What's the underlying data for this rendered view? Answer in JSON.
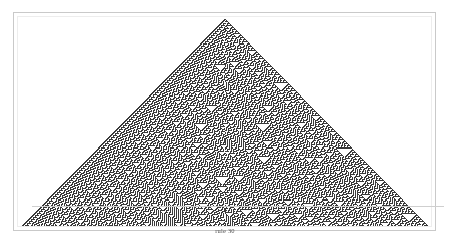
{
  "figure": {
    "caption": "rule 30",
    "title": "rule 30",
    "frame_color": "#c9c9c9",
    "background_color": "#ffffff",
    "cell_on_color": "#3a3a3a",
    "cell_off_color": "#ffffff"
  },
  "chart_data": {
    "type": "heatmap",
    "title": "rule 30",
    "subtitle": "",
    "xlabel": "",
    "ylabel": "",
    "rule_number": 30,
    "rule_binary": "00011110",
    "rule_table": [
      {
        "neighborhood": "111",
        "result": 0
      },
      {
        "neighborhood": "110",
        "result": 0
      },
      {
        "neighborhood": "101",
        "result": 0
      },
      {
        "neighborhood": "100",
        "result": 1
      },
      {
        "neighborhood": "011",
        "result": 1
      },
      {
        "neighborhood": "010",
        "result": 1
      },
      {
        "neighborhood": "001",
        "result": 1
      },
      {
        "neighborhood": "000",
        "result": 0
      }
    ],
    "initial_condition": "single black cell",
    "generations": 204,
    "width_cells": 409,
    "center_cell_index": 204,
    "grid": false,
    "legend": "none",
    "colors": {
      "on": "#3a3a3a",
      "off": "#ffffff"
    },
    "xlim": [
      0,
      409
    ],
    "ylim": [
      0,
      204
    ]
  }
}
